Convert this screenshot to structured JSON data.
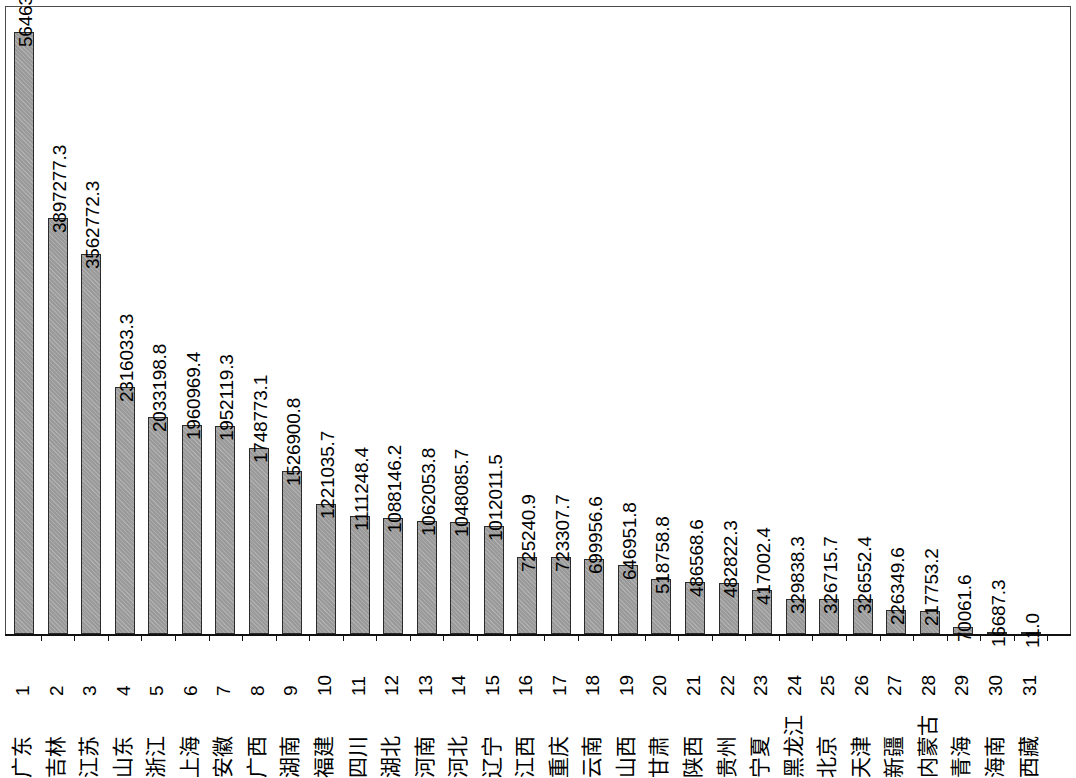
{
  "chart_data": {
    "type": "bar",
    "title": "",
    "subtitle": "",
    "xlabel": "",
    "ylabel": "",
    "grid": false,
    "legend": "none",
    "orientation": "vertical",
    "ylim": [
      0,
      5646327.1
    ],
    "categories": [
      "广东",
      "吉林",
      "江苏",
      "山东",
      "浙江",
      "上海",
      "安徽",
      "广西",
      "湖南",
      "福建",
      "四川",
      "湖北",
      "河南",
      "河北",
      "辽宁",
      "江西",
      "重庆",
      "云南",
      "山西",
      "甘肃",
      "陕西",
      "贵州",
      "宁夏",
      "黑龙江",
      "北京",
      "天津",
      "新疆",
      "内蒙古",
      "青海",
      "海南",
      "西藏"
    ],
    "x": [
      "1",
      "2",
      "3",
      "4",
      "5",
      "6",
      "7",
      "8",
      "9",
      "10",
      "11",
      "12",
      "13",
      "14",
      "15",
      "16",
      "17",
      "18",
      "19",
      "20",
      "21",
      "22",
      "23",
      "24",
      "25",
      "26",
      "27",
      "28",
      "29",
      "30",
      "31"
    ],
    "values": [
      5646327.1,
      3897277.3,
      3562772.3,
      2316033.3,
      2033198.8,
      1960969.4,
      1952119.3,
      1748773.1,
      1526900.8,
      1221035.7,
      1111248.4,
      1088146.2,
      1062053.8,
      1048085.7,
      1012011.5,
      725240.9,
      723307.7,
      699956.6,
      646951.8,
      518758.8,
      486568.6,
      482822.3,
      417002.4,
      329838.3,
      326715.7,
      326552.4,
      226349.6,
      217753.2,
      70061.6,
      16687.3,
      11.0
    ],
    "value_labels": [
      "5646327.1",
      "3897277.3",
      "3562772.3",
      "2316033.3",
      "2033198.8",
      "1960969.4",
      "1952119.3",
      "1748773.1",
      "1526900.8",
      "1221035.7",
      "1111248.4",
      "1088146.2",
      "1062053.8",
      "1048085.7",
      "1012011.5",
      "725240.9",
      "723307.7",
      "699956.6",
      "646951.8",
      "518758.8",
      "486568.6",
      "482822.3",
      "417002.4",
      "329838.3",
      "326715.7",
      "326552.4",
      "226349.6",
      "217753.2",
      "70061.6",
      "16687.3",
      "11.0"
    ]
  },
  "style": {
    "bar_fill": "#9a9a9a",
    "bar_border": "#2b2b2b",
    "axis_color": "#111111",
    "frame_color": "#4a4a4a",
    "text_color": "#000000",
    "background": "#ffffff"
  },
  "geometry": {
    "first_bar_left": 14,
    "bar_width": 20,
    "bar_pitch": 33.55,
    "baseline_y": 634,
    "plot_top_y": 32,
    "plot_height_px": 602
  }
}
